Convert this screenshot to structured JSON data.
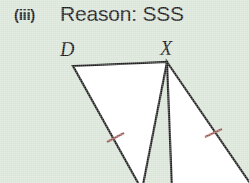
{
  "page": {
    "width": 249,
    "height": 183,
    "background_color": "#d8e4d6",
    "figure_fill_color": "#ffffff",
    "stroke_color": "#1e1e1e",
    "tick_color": "#9e5a52"
  },
  "heading": {
    "numeral": "(iii)",
    "reason": "Reason: SSS"
  },
  "figure": {
    "vertex_labels": [
      {
        "name": "D",
        "text": "D",
        "x": 60,
        "y": 56
      },
      {
        "name": "X",
        "text": "X",
        "x": 160,
        "y": 55
      }
    ],
    "congruence_marks": {
      "count": 2,
      "style": "single-tick",
      "left_tick": {
        "x": 115,
        "y": 138
      },
      "right_tick": {
        "x": 213,
        "y": 133
      }
    },
    "shapes": [
      {
        "name": "left-triangle",
        "points": "73,66 167,62 142,183 73,66",
        "description": "triangle with apex D at top-left, X at top-right, third vertex below the visible crop"
      },
      {
        "name": "right-triangle",
        "points": "167,62 249,183 171,183 167,62",
        "description": "triangle with apex X at top, extending down-right beyond the crop"
      }
    ]
  }
}
